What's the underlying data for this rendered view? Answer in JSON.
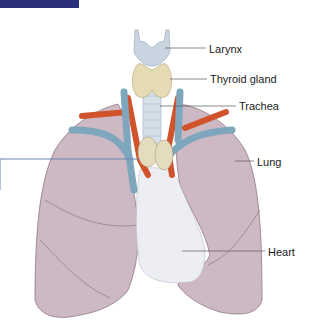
{
  "figure": {
    "title_bar_color": "#2a2f7a",
    "labels": [
      {
        "id": "larynx",
        "text": "Larynx",
        "x": 209,
        "y": 43
      },
      {
        "id": "thyroid",
        "text": "Thyroid gland",
        "x": 210,
        "y": 73
      },
      {
        "id": "trachea",
        "text": "Trachea",
        "x": 239,
        "y": 100
      },
      {
        "id": "lung",
        "text": "Lung",
        "x": 257,
        "y": 156
      },
      {
        "id": "heart",
        "text": "Heart",
        "x": 268,
        "y": 246
      }
    ],
    "colors": {
      "lung": "#cdb9c4",
      "lung_edge": "#8e7683",
      "heart": "#eceef3",
      "vein": "#7ea6bd",
      "artery": "#d0532c",
      "thyroid": "#e5dcb4",
      "larynx": "#c9d6e2",
      "trachea": "#d5e0e8",
      "leader_line": "#5a5a5a",
      "callout_line": "#6b86b3"
    }
  }
}
